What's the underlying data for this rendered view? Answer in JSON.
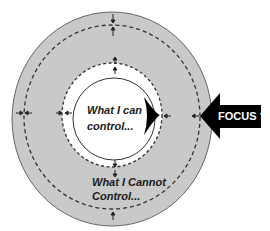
{
  "diagram": {
    "inner_label_line1": "What I can",
    "inner_label_line2": "control...",
    "outer_label_line1": "What I Cannot",
    "outer_label_line2": "Control...",
    "arrow_label": "FOCUS ?"
  },
  "colors": {
    "outer_fill": "#c9c9c9",
    "inner_fill": "#ffffff",
    "stroke": "#333333",
    "arrow": "#000000"
  }
}
